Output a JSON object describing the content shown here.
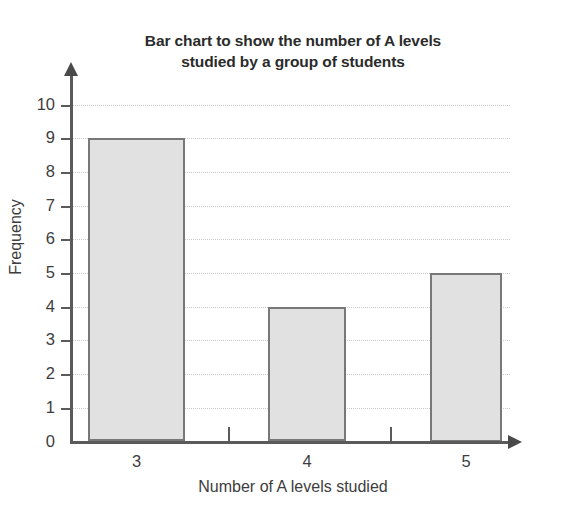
{
  "chart_data": {
    "type": "bar",
    "title": "Bar chart to show the number of A levels studied by a group of students",
    "title_lines": [
      "Bar chart to show the number of A levels",
      "studied by a group of students"
    ],
    "categories": [
      "3",
      "4",
      "5"
    ],
    "values": [
      9,
      4,
      5
    ],
    "xlabel": "Number of A levels studied",
    "ylabel": "Frequency",
    "ylim": [
      0,
      10
    ],
    "ytick_labels": [
      "0",
      "1",
      "2",
      "3",
      "4",
      "5",
      "6",
      "7",
      "8",
      "9",
      "10"
    ],
    "ytick_values": [
      0,
      1,
      2,
      3,
      4,
      5,
      6,
      7,
      8,
      9,
      10
    ],
    "grid": true,
    "grid_axis": "y",
    "grid_style": "dotted",
    "legend": null,
    "bar_fill_color": "#e1e1e1",
    "bar_border_color": "#787878",
    "axis_color": "#5a5a5a",
    "grid_color": "#c9c9c9",
    "text_color": "#3d3d3d",
    "title_color": "#2b2b2b",
    "background_color": "#ffffff",
    "axis_arrows": true,
    "x_separator_ticks": true
  }
}
